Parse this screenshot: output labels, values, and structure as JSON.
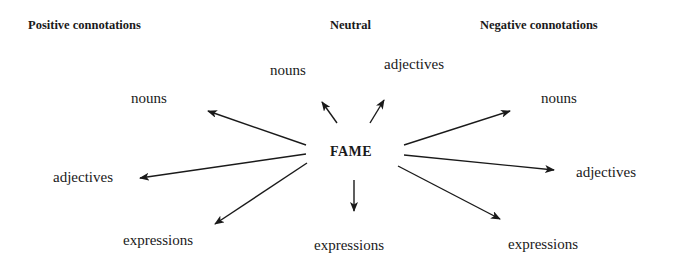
{
  "headers": {
    "positive": "Positive connotations",
    "neutral": "Neutral",
    "negative": "Negative connotations"
  },
  "center": "FAME",
  "positive": {
    "nouns": "nouns",
    "adjectives": "adjectives",
    "expressions": "expressions"
  },
  "neutral": {
    "nouns": "nouns",
    "adjectives": "adjectives",
    "expressions": "expressions"
  },
  "negative": {
    "nouns": "nouns",
    "adjectives": "adjectives",
    "expressions": "expressions"
  },
  "arrows": [
    {
      "to": "positive.nouns",
      "x1": 306,
      "y1": 145,
      "x2": 208,
      "y2": 111
    },
    {
      "to": "positive.adjectives",
      "x1": 306,
      "y1": 154,
      "x2": 140,
      "y2": 178
    },
    {
      "to": "positive.expressions",
      "x1": 307,
      "y1": 163,
      "x2": 215,
      "y2": 224
    },
    {
      "to": "neutral.nouns",
      "x1": 337,
      "y1": 123,
      "x2": 322,
      "y2": 102
    },
    {
      "to": "neutral.adjectives",
      "x1": 370,
      "y1": 123,
      "x2": 384,
      "y2": 100
    },
    {
      "to": "neutral.expressions",
      "x1": 354,
      "y1": 180,
      "x2": 354,
      "y2": 211
    },
    {
      "to": "negative.nouns",
      "x1": 404,
      "y1": 145,
      "x2": 510,
      "y2": 111
    },
    {
      "to": "negative.adjectives",
      "x1": 404,
      "y1": 155,
      "x2": 554,
      "y2": 170
    },
    {
      "to": "negative.expressions",
      "x1": 398,
      "y1": 166,
      "x2": 500,
      "y2": 219
    }
  ]
}
